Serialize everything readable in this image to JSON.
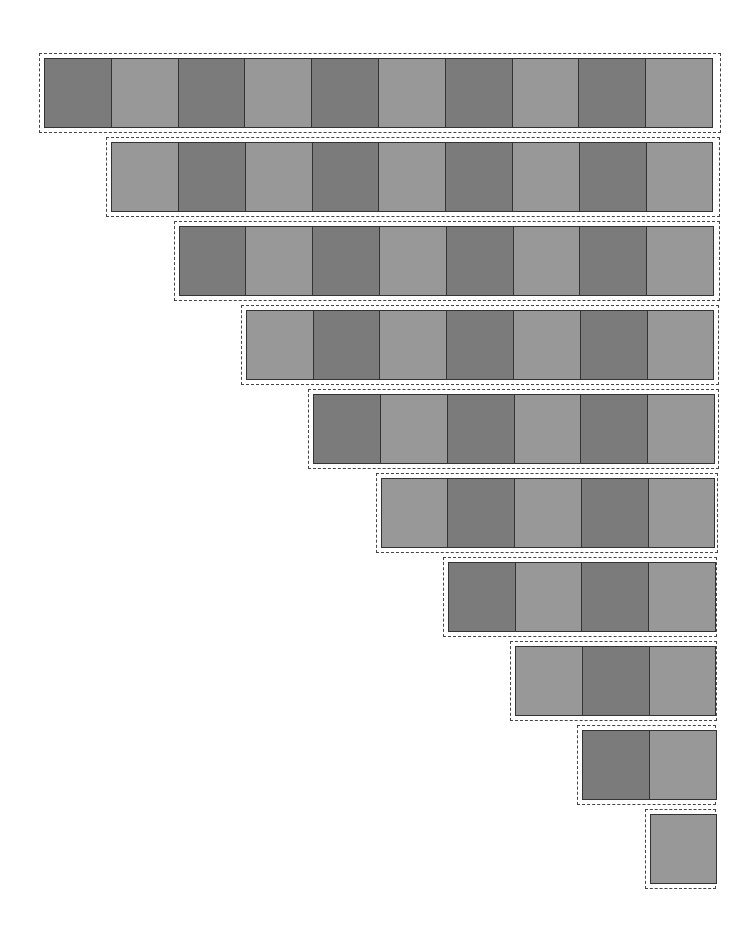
{
  "diagram": {
    "type": "staircase-checkerboard",
    "colors": {
      "dark": "#7b7b7b",
      "light": "#989898",
      "border": "#333333",
      "dashed": "#444444"
    },
    "rows": [
      {
        "index": 1,
        "count": 10,
        "start": "dark"
      },
      {
        "index": 2,
        "count": 9,
        "start": "light"
      },
      {
        "index": 3,
        "count": 8,
        "start": "dark"
      },
      {
        "index": 4,
        "count": 7,
        "start": "light"
      },
      {
        "index": 5,
        "count": 6,
        "start": "dark"
      },
      {
        "index": 6,
        "count": 5,
        "start": "light"
      },
      {
        "index": 7,
        "count": 4,
        "start": "dark"
      },
      {
        "index": 8,
        "count": 3,
        "start": "light"
      },
      {
        "index": 9,
        "count": 2,
        "start": "dark"
      },
      {
        "index": 10,
        "count": 1,
        "start": "light"
      }
    ]
  }
}
